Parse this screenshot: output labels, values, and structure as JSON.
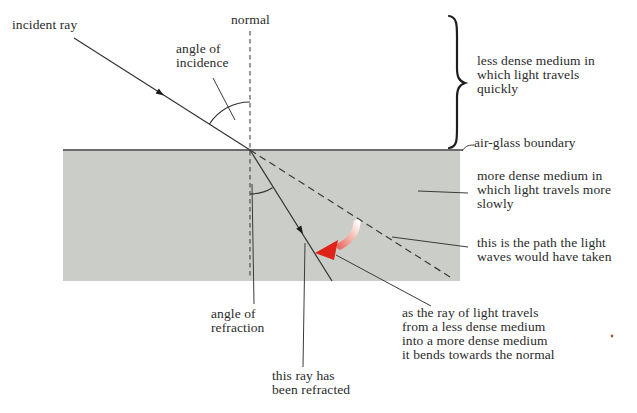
{
  "figure": {
    "title_hint": "refraction of light at an air-glass boundary",
    "labels": {
      "incident_ray": "incident ray",
      "normal": "normal",
      "angle_of_incidence": "angle of\nincidence",
      "less_dense": "less dense medium in\nwhich light travels\nquickly",
      "air_glass_boundary": "air-glass boundary",
      "more_dense": "more dense medium in\nwhich light travels more\nslowly",
      "path_taken": "this is the path the light\nwaves would have taken",
      "angle_of_refraction": "angle of\nrefraction",
      "refracted_ray_note": "this ray has\nbeen refracted",
      "bends_note": "as the ray of light travels\nfrom a less dense medium\ninto a more dense medium\nit bends towards the normal"
    },
    "colors": {
      "background": "#ffffff",
      "glass_fill": "#cbcdc9",
      "boundary_line": "#4a4a4a",
      "ray_line": "#333333",
      "text": "#2b2b2b",
      "red_arrow": "#df2318",
      "red_arrow_tail": "#ffffff",
      "speck": "#9b5b40"
    }
  }
}
